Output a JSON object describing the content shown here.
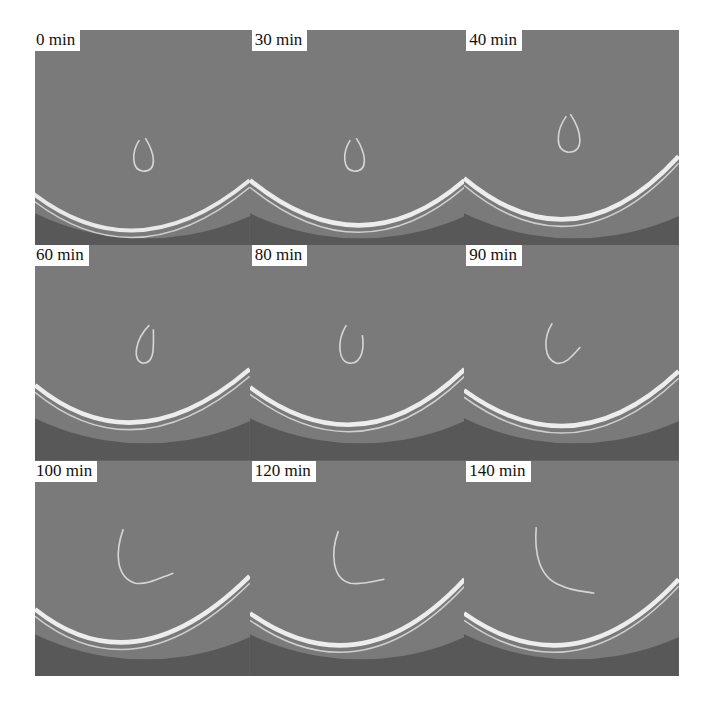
{
  "figure": {
    "layout": {
      "rows": 3,
      "columns": 3
    },
    "colors": {
      "page_background": "#ffffff",
      "dish_interior": "#777777",
      "dish_exterior": "#555555",
      "dish_rim": "#e6e6e6",
      "filament": "#d8d8d8",
      "label_background": "#ffffff",
      "label_text": "#111111"
    },
    "panels": [
      {
        "label": "0 min",
        "shape": "closed-loop"
      },
      {
        "label": "30 min",
        "shape": "closed-loop"
      },
      {
        "label": "40 min",
        "shape": "closed-loop"
      },
      {
        "label": "60 min",
        "shape": "loop-opening"
      },
      {
        "label": "80 min",
        "shape": "u-shape"
      },
      {
        "label": "90 min",
        "shape": "open-u"
      },
      {
        "label": "100 min",
        "shape": "hook"
      },
      {
        "label": "120 min",
        "shape": "hook"
      },
      {
        "label": "140 min",
        "shape": "hook-extended"
      }
    ]
  }
}
